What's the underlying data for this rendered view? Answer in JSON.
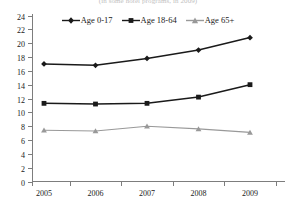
{
  "chart_data": {
    "type": "line",
    "title": "(in some hotel programs, in 2009)",
    "xlabel": "",
    "ylabel": "",
    "categories": [
      "2005",
      "2006",
      "2007",
      "2008",
      "2009"
    ],
    "x": [
      2005,
      2006,
      2007,
      2008,
      2009
    ],
    "ylim": [
      0,
      24
    ],
    "ytick_step": 2,
    "yticks": [
      "0",
      "2",
      "4",
      "6",
      "8",
      "10",
      "12",
      "14",
      "16",
      "18",
      "20",
      "22",
      "24"
    ],
    "grid": false,
    "legend_position": "top-center",
    "series": [
      {
        "name": "Age 0-17",
        "marker": "diamond",
        "color": "#1a1a1a",
        "values": [
          17.0,
          16.8,
          17.8,
          19.0,
          20.8
        ]
      },
      {
        "name": "Age 18-64",
        "marker": "square",
        "color": "#1a1a1a",
        "values": [
          11.3,
          11.2,
          11.3,
          12.2,
          14.0
        ]
      },
      {
        "name": "Age 65+",
        "marker": "triangle",
        "color": "#999999",
        "values": [
          7.4,
          7.3,
          8.0,
          7.6,
          7.1
        ]
      }
    ]
  }
}
